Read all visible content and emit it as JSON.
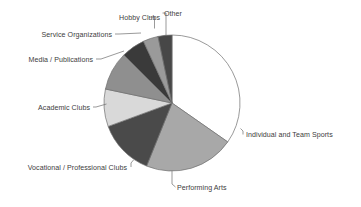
{
  "chart_data": {
    "type": "pie",
    "title": "",
    "subtitle": "",
    "xlabel": "",
    "ylabel": "",
    "legend_position": "none",
    "grid": false,
    "labels_as_callouts": true,
    "start_angle_deg": 0,
    "direction": "clockwise",
    "categories": [
      "Individual and Team Sports",
      "Performing Arts",
      "Vocational / Professional Clubs",
      "Academic Clubs",
      "Media / Publications",
      "Service Organizations",
      "Hobby Clubs",
      "Other"
    ],
    "values": [
      34.7,
      21.4,
      13.3,
      8.9,
      9.2,
      5.6,
      3.6,
      3.3
    ],
    "value_unit": "percent",
    "colors": [
      "#ffffff",
      "#a8a8a8",
      "#4a4a4a",
      "#d9d9d9",
      "#8f8f8f",
      "#3a3a3a",
      "#9a9a9a",
      "#474747"
    ]
  },
  "slices": [
    {
      "label": "Individual and Team Sports",
      "value": 34.7,
      "color": "#ffffff",
      "label_side": "right"
    },
    {
      "label": "Performing Arts",
      "value": 21.4,
      "color": "#a8a8a8",
      "label_side": "bottom"
    },
    {
      "label": "Vocational / Professional Clubs",
      "value": 13.3,
      "color": "#4a4a4a",
      "label_side": "left"
    },
    {
      "label": "Academic Clubs",
      "value": 8.9,
      "color": "#d9d9d9",
      "label_side": "left"
    },
    {
      "label": "Media / Publications",
      "value": 9.2,
      "color": "#8f8f8f",
      "label_side": "left"
    },
    {
      "label": "Service Organizations",
      "value": 5.6,
      "color": "#3a3a3a",
      "label_side": "left"
    },
    {
      "label": "Hobby Clubs",
      "value": 3.6,
      "color": "#9a9a9a",
      "label_side": "top"
    },
    {
      "label": "Other",
      "value": 3.3,
      "color": "#474747",
      "label_side": "top"
    }
  ],
  "geometry": {
    "center_x": 172,
    "center_y": 103,
    "radius": 68
  }
}
